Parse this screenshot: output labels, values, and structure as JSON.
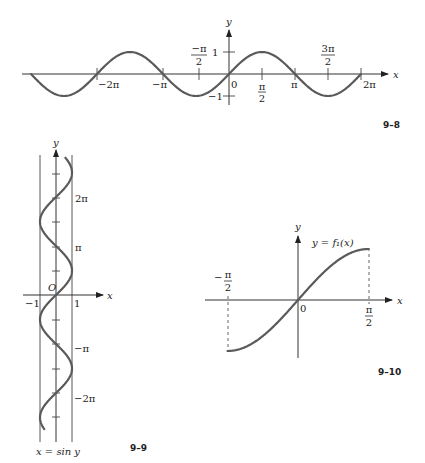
{
  "figures": {
    "fig_9_8": {
      "label": "9–8",
      "x_axis_label": "x",
      "y_axis_label": "y",
      "x_tick_labels": [
        "−2π",
        "−π",
        "0",
        "π",
        "2π"
      ],
      "frac_neg_half_pi": {
        "num": "−π",
        "den": "2"
      },
      "frac_half_pi": {
        "num": "π",
        "den": "2"
      },
      "frac_three_half_pi": {
        "num": "3π",
        "den": "2"
      },
      "y_tick_labels": [
        "1",
        "−1"
      ]
    },
    "fig_9_9": {
      "label": "9–9",
      "x_axis_label": "x",
      "y_axis_label": "y",
      "origin_label": "O",
      "x_tick_labels": [
        "−1",
        "1"
      ],
      "y_tick_labels": [
        "2π",
        "π",
        "−π",
        "−2π"
      ],
      "curve_label": "x = sin y"
    },
    "fig_9_10": {
      "label": "9–10",
      "x_axis_label": "x",
      "y_axis_label": "y",
      "origin_label": "0",
      "frac_neg_half_pi": {
        "num": "π",
        "den": "2",
        "sign": "−"
      },
      "frac_half_pi": {
        "num": "π",
        "den": "2"
      },
      "curve_label": "y = f₁(x)"
    }
  },
  "chart_data": [
    {
      "type": "line",
      "title": "9–8",
      "function": "y = sin x",
      "xlabel": "x",
      "ylabel": "y",
      "xlim": [
        -9.42,
        6.28
      ],
      "ylim": [
        -1,
        1
      ],
      "x_ticks": [
        "−2π",
        "−π",
        "−π/2",
        "0",
        "π/2",
        "π",
        "3π/2",
        "2π"
      ],
      "y_ticks": [
        "1",
        "−1"
      ],
      "grid": false
    },
    {
      "type": "line",
      "title": "9–9",
      "function": "x = sin y",
      "xlabel": "x",
      "ylabel": "y",
      "xlim": [
        -1,
        1
      ],
      "ylim": [
        -8.6,
        8.8
      ],
      "x_ticks": [
        "−1",
        "1"
      ],
      "y_ticks": [
        "2π",
        "π",
        "−π",
        "−2π"
      ],
      "grid": false
    },
    {
      "type": "line",
      "title": "9–10",
      "function": "y = f₁(x) = sin x, −π/2 ≤ x ≤ π/2",
      "xlabel": "x",
      "ylabel": "y",
      "xlim": [
        -1.5708,
        1.5708
      ],
      "ylim": [
        -1,
        1
      ],
      "x_ticks": [
        "−π/2",
        "0",
        "π/2"
      ],
      "grid": false
    }
  ]
}
